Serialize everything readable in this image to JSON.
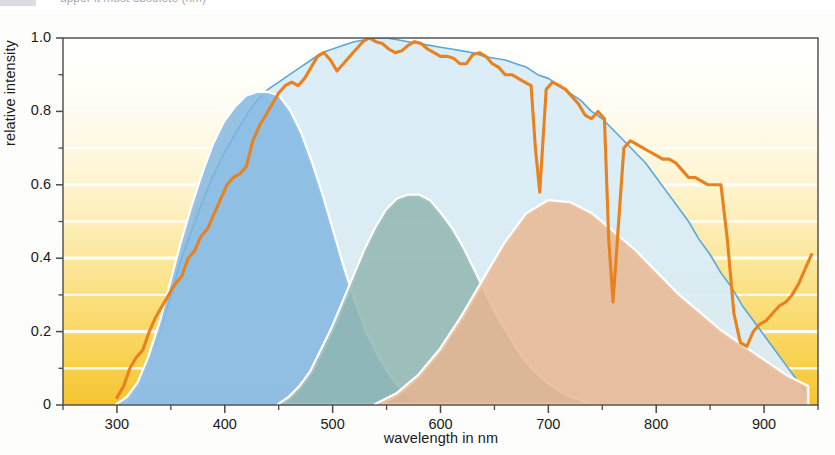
{
  "figure": {
    "caption_partial": "upper it must obsolete (nm)",
    "background_top_color": "#ffffff",
    "background_bottom_color": "#f6c738"
  },
  "chart_data": {
    "type": "area",
    "title": "",
    "xlabel": "wavelength in nm",
    "ylabel": "relative intensity",
    "xlim": [
      250,
      950
    ],
    "ylim": [
      0,
      1.0
    ],
    "xticks": [
      300,
      400,
      500,
      600,
      700,
      800,
      900
    ],
    "xtick_labels": [
      "300",
      "400",
      "500",
      "600",
      "700",
      "800",
      "900"
    ],
    "xminor_step": 50,
    "yticks": [
      0,
      0.2,
      0.4,
      0.6,
      0.8,
      1.0
    ],
    "ytick_labels": [
      "0",
      "0.2",
      "0.4",
      "0.6",
      "0.8",
      "1.0"
    ],
    "yminor_step": 0.1,
    "grid": "horizontal-white-lines",
    "legend": "inline-annotations",
    "series": [
      {
        "name": "triple cell overall",
        "kind": "area-outline",
        "fill": "#d9ecf7",
        "stroke": "#5aa8d8",
        "x": [
          300,
          310,
          320,
          330,
          340,
          350,
          360,
          370,
          380,
          390,
          400,
          410,
          420,
          430,
          440,
          450,
          460,
          470,
          480,
          490,
          500,
          510,
          520,
          530,
          540,
          550,
          560,
          570,
          580,
          590,
          600,
          610,
          620,
          630,
          640,
          650,
          660,
          670,
          680,
          690,
          700,
          710,
          720,
          730,
          740,
          750,
          760,
          770,
          780,
          790,
          800,
          810,
          820,
          830,
          840,
          850,
          860,
          870,
          880,
          890,
          900,
          910,
          920,
          930,
          940
        ],
        "values": [
          0.0,
          0.02,
          0.06,
          0.12,
          0.2,
          0.3,
          0.4,
          0.48,
          0.56,
          0.63,
          0.69,
          0.74,
          0.79,
          0.83,
          0.86,
          0.88,
          0.9,
          0.92,
          0.94,
          0.96,
          0.97,
          0.98,
          0.99,
          0.995,
          1.0,
          1.0,
          0.995,
          0.99,
          0.985,
          0.98,
          0.975,
          0.97,
          0.965,
          0.96,
          0.95,
          0.945,
          0.94,
          0.93,
          0.92,
          0.9,
          0.89,
          0.87,
          0.85,
          0.83,
          0.8,
          0.78,
          0.75,
          0.72,
          0.69,
          0.66,
          0.62,
          0.58,
          0.54,
          0.5,
          0.45,
          0.41,
          0.36,
          0.32,
          0.27,
          0.23,
          0.19,
          0.15,
          0.11,
          0.07,
          0.03
        ]
      },
      {
        "name": "blue-absorbing cell",
        "kind": "area",
        "fill": "#7fb5e0",
        "x": [
          300,
          310,
          320,
          330,
          340,
          350,
          360,
          370,
          380,
          390,
          400,
          410,
          420,
          430,
          440,
          450,
          460,
          470,
          480,
          490,
          500,
          510,
          520,
          530,
          540,
          550,
          560,
          570,
          580
        ],
        "values": [
          0.0,
          0.02,
          0.06,
          0.13,
          0.22,
          0.33,
          0.44,
          0.54,
          0.63,
          0.71,
          0.77,
          0.81,
          0.84,
          0.85,
          0.85,
          0.84,
          0.8,
          0.74,
          0.66,
          0.57,
          0.47,
          0.37,
          0.28,
          0.2,
          0.14,
          0.09,
          0.05,
          0.02,
          0.0
        ]
      },
      {
        "name": "green-absorbing cell",
        "kind": "area",
        "fill": "#8fb5b0",
        "x": [
          450,
          460,
          470,
          480,
          490,
          500,
          510,
          520,
          530,
          540,
          550,
          560,
          570,
          580,
          590,
          600,
          610,
          620,
          630,
          640,
          650,
          660,
          670,
          680,
          690,
          700,
          710,
          720,
          730,
          740
        ],
        "values": [
          0.0,
          0.02,
          0.05,
          0.09,
          0.15,
          0.21,
          0.28,
          0.35,
          0.42,
          0.48,
          0.53,
          0.56,
          0.57,
          0.57,
          0.555,
          0.52,
          0.48,
          0.43,
          0.37,
          0.31,
          0.25,
          0.2,
          0.15,
          0.11,
          0.08,
          0.055,
          0.035,
          0.02,
          0.01,
          0.0
        ]
      },
      {
        "name": "red absorbing cell",
        "kind": "area",
        "fill": "#e9b48f",
        "x": [
          540,
          560,
          580,
          600,
          620,
          640,
          660,
          680,
          700,
          720,
          740,
          760,
          780,
          800,
          820,
          840,
          860,
          880,
          900,
          920,
          940
        ],
        "values": [
          0.0,
          0.03,
          0.08,
          0.15,
          0.24,
          0.34,
          0.44,
          0.52,
          0.555,
          0.55,
          0.52,
          0.47,
          0.42,
          0.36,
          0.3,
          0.25,
          0.2,
          0.16,
          0.12,
          0.08,
          0.05
        ]
      },
      {
        "name": "solar spectrum",
        "kind": "line",
        "stroke": "#e8821e",
        "x": [
          300,
          306,
          312,
          318,
          324,
          330,
          336,
          342,
          348,
          354,
          360,
          366,
          372,
          378,
          384,
          390,
          396,
          402,
          408,
          414,
          420,
          426,
          432,
          438,
          444,
          450,
          456,
          462,
          468,
          474,
          480,
          486,
          492,
          498,
          504,
          510,
          516,
          522,
          528,
          534,
          540,
          546,
          552,
          558,
          564,
          570,
          576,
          582,
          588,
          594,
          600,
          606,
          612,
          618,
          624,
          630,
          636,
          642,
          648,
          654,
          660,
          666,
          672,
          678,
          684,
          688,
          692,
          698,
          704,
          710,
          716,
          722,
          728,
          734,
          740,
          746,
          752,
          756,
          760,
          764,
          770,
          776,
          782,
          788,
          794,
          800,
          806,
          812,
          818,
          824,
          830,
          836,
          842,
          848,
          854,
          860,
          866,
          872,
          878,
          884,
          890,
          896,
          902,
          908,
          914,
          920,
          926,
          932,
          938,
          944
        ],
        "values": [
          0.02,
          0.05,
          0.1,
          0.13,
          0.15,
          0.2,
          0.24,
          0.27,
          0.3,
          0.33,
          0.35,
          0.4,
          0.42,
          0.46,
          0.48,
          0.52,
          0.56,
          0.6,
          0.62,
          0.63,
          0.65,
          0.72,
          0.76,
          0.79,
          0.82,
          0.85,
          0.87,
          0.88,
          0.87,
          0.89,
          0.92,
          0.95,
          0.96,
          0.94,
          0.91,
          0.93,
          0.95,
          0.97,
          0.99,
          1.0,
          0.99,
          0.985,
          0.97,
          0.96,
          0.965,
          0.98,
          0.99,
          0.985,
          0.97,
          0.96,
          0.95,
          0.95,
          0.945,
          0.93,
          0.93,
          0.955,
          0.96,
          0.95,
          0.93,
          0.92,
          0.9,
          0.9,
          0.89,
          0.88,
          0.87,
          0.7,
          0.58,
          0.86,
          0.88,
          0.87,
          0.86,
          0.84,
          0.82,
          0.79,
          0.78,
          0.8,
          0.78,
          0.45,
          0.28,
          0.45,
          0.7,
          0.72,
          0.71,
          0.7,
          0.69,
          0.68,
          0.67,
          0.67,
          0.66,
          0.64,
          0.62,
          0.62,
          0.61,
          0.6,
          0.6,
          0.6,
          0.45,
          0.25,
          0.17,
          0.16,
          0.2,
          0.22,
          0.23,
          0.25,
          0.27,
          0.28,
          0.3,
          0.33,
          0.37,
          0.41
        ]
      }
    ],
    "annotations": [
      {
        "text": "triple cell overall",
        "x": 540,
        "y": 0.73
      },
      {
        "text": "blue-absorbing\ncell",
        "x": 405,
        "y": 0.43
      },
      {
        "text": "green-absorbing\ncell",
        "x": 570,
        "y": 0.43
      },
      {
        "text": "red absorbing\ncell",
        "x": 720,
        "y": 0.43
      }
    ]
  }
}
